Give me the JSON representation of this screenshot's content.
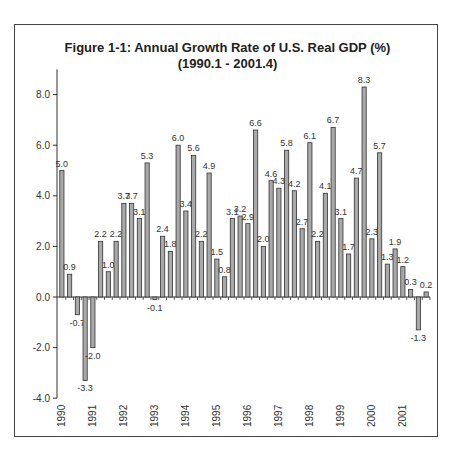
{
  "title_line1": "Figure 1-1: Annual Growth Rate of U.S. Real GDP (%)",
  "title_line2": "(1990.1 - 2001.4)",
  "chart_data": {
    "type": "bar",
    "title": "Figure 1-1: Annual Growth Rate of U.S. Real GDP (%)",
    "subtitle": "(1990.1 - 2001.4)",
    "xlabel": "",
    "ylabel": "",
    "ylim": [
      -4.0,
      9.0
    ],
    "yticks": [
      "-4.0",
      "-2.0",
      "0.0",
      "2.0",
      "4.0",
      "6.0",
      "8.0"
    ],
    "x_year_labels": [
      "1990",
      "1991",
      "1992",
      "1993",
      "1994",
      "1995",
      "1996",
      "1997",
      "1998",
      "1999",
      "2000",
      "2001"
    ],
    "categories": [
      "1990.1",
      "1990.2",
      "1990.3",
      "1990.4",
      "1991.1",
      "1991.2",
      "1991.3",
      "1991.4",
      "1992.1",
      "1992.2",
      "1992.3",
      "1992.4",
      "1993.1",
      "1993.2",
      "1993.3",
      "1993.4",
      "1994.1",
      "1994.2",
      "1994.3",
      "1994.4",
      "1995.1",
      "1995.2",
      "1995.3",
      "1995.4",
      "1996.1",
      "1996.2",
      "1996.3",
      "1996.4",
      "1997.1",
      "1997.2",
      "1997.3",
      "1997.4",
      "1998.1",
      "1998.2",
      "1998.3",
      "1998.4",
      "1999.1",
      "1999.2",
      "1999.3",
      "1999.4",
      "2000.1",
      "2000.2",
      "2000.3",
      "2000.4",
      "2001.1",
      "2001.2",
      "2001.3",
      "2001.4"
    ],
    "values": [
      5.0,
      0.9,
      -0.7,
      -3.3,
      -2.0,
      2.2,
      1.0,
      2.2,
      3.7,
      3.7,
      3.1,
      5.3,
      -0.1,
      2.4,
      1.8,
      6.0,
      3.4,
      5.6,
      2.2,
      4.9,
      1.5,
      0.8,
      3.1,
      3.2,
      2.9,
      6.6,
      2.0,
      4.6,
      4.3,
      5.8,
      4.2,
      2.7,
      6.1,
      2.2,
      4.1,
      6.7,
      3.1,
      1.7,
      4.7,
      8.3,
      2.3,
      5.7,
      1.3,
      1.9,
      1.2,
      0.3,
      -1.3,
      0.2
    ],
    "grid": false,
    "legend": null,
    "bar_color": "#a9a9a9",
    "bar_edge_color": "#333333"
  }
}
